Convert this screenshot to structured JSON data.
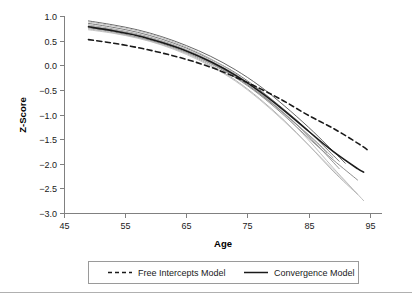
{
  "chart_data": {
    "type": "line",
    "title": "",
    "xlabel": "Age",
    "ylabel": "Z-Score",
    "xlim": [
      45,
      97
    ],
    "ylim": [
      -3.0,
      1.0
    ],
    "grid": false,
    "legend_position": "bottom",
    "xticks": [
      45,
      55,
      65,
      75,
      85,
      95
    ],
    "xtick_labels": [
      "45",
      "55",
      "65",
      "75",
      "85",
      "95"
    ],
    "yticks": [
      1.0,
      0.5,
      0.0,
      -0.5,
      -1.0,
      -1.5,
      -2.0,
      -2.5,
      -3.0
    ],
    "ytick_labels": [
      "1.0",
      "0.5",
      "0.0",
      "-0.5",
      "-1.0",
      "-1.5",
      "-2.0",
      "-2.5",
      "-3.0"
    ],
    "x": [
      49,
      53,
      57,
      61,
      65,
      69,
      73,
      77,
      81,
      85,
      89,
      93,
      95
    ],
    "series": [
      {
        "name": "Free Intercepts Model",
        "style": "dashed",
        "color": "#1a1a1a",
        "width": 1.6,
        "x": [
          49,
          53,
          57,
          61,
          65,
          69,
          73,
          77,
          81,
          85,
          89,
          93,
          95
        ],
        "values": [
          0.52,
          0.45,
          0.36,
          0.25,
          0.12,
          -0.04,
          -0.24,
          -0.47,
          -0.73,
          -1.02,
          -1.28,
          -1.58,
          -1.75
        ]
      },
      {
        "name": "Convergence Model",
        "style": "solid",
        "color": "#1a1a1a",
        "width": 1.6,
        "x": [
          49,
          53,
          57,
          61,
          65,
          69,
          73,
          77,
          81,
          85,
          89,
          93,
          94
        ],
        "values": [
          0.78,
          0.7,
          0.6,
          0.46,
          0.29,
          0.07,
          -0.2,
          -0.53,
          -0.92,
          -1.34,
          -1.75,
          -2.1,
          -2.17
        ]
      },
      {
        "name": "cohort-1",
        "style": "solid",
        "color": "#555555",
        "width": 0.9,
        "x": [
          49,
          53,
          57,
          61,
          65,
          69,
          73,
          77,
          81,
          85,
          88,
          91
        ],
        "values": [
          0.9,
          0.82,
          0.72,
          0.58,
          0.4,
          0.18,
          -0.09,
          -0.42,
          -0.82,
          -1.26,
          -1.62,
          -1.99
        ]
      },
      {
        "name": "cohort-2",
        "style": "solid",
        "color": "#6a6a6a",
        "width": 0.9,
        "x": [
          49,
          53,
          57,
          61,
          65,
          69,
          73,
          77,
          81,
          84,
          87,
          90
        ],
        "values": [
          0.85,
          0.77,
          0.67,
          0.53,
          0.35,
          0.12,
          -0.15,
          -0.5,
          -0.9,
          -1.22,
          -1.58,
          -1.95
        ]
      },
      {
        "name": "cohort-3",
        "style": "solid",
        "color": "#808080",
        "width": 0.9,
        "x": [
          49,
          53,
          57,
          61,
          65,
          69,
          73,
          77,
          81,
          85,
          89,
          93
        ],
        "values": [
          0.76,
          0.68,
          0.57,
          0.44,
          0.26,
          0.03,
          -0.25,
          -0.6,
          -1.02,
          -1.48,
          -1.92,
          -2.33
        ]
      },
      {
        "name": "cohort-4",
        "style": "solid",
        "color": "#949494",
        "width": 0.9,
        "x": [
          49,
          53,
          57,
          61,
          65,
          69,
          73,
          77,
          80,
          83,
          86,
          89
        ],
        "values": [
          0.8,
          0.72,
          0.62,
          0.48,
          0.3,
          0.07,
          -0.22,
          -0.58,
          -0.88,
          -1.2,
          -1.52,
          -1.88
        ]
      },
      {
        "name": "cohort-5",
        "style": "solid",
        "color": "#a8a8a8",
        "width": 0.9,
        "x": [
          49,
          53,
          57,
          61,
          65,
          69,
          73,
          77,
          81,
          85,
          89,
          93
        ],
        "values": [
          0.74,
          0.66,
          0.56,
          0.42,
          0.24,
          0.0,
          -0.3,
          -0.68,
          -1.12,
          -1.62,
          -2.15,
          -2.62
        ]
      },
      {
        "name": "cohort-6",
        "style": "solid",
        "color": "#b5b5b5",
        "width": 0.9,
        "x": [
          49,
          53,
          57,
          61,
          65,
          69,
          73,
          77,
          81,
          85,
          89,
          94
        ],
        "values": [
          0.88,
          0.8,
          0.7,
          0.56,
          0.37,
          0.13,
          -0.17,
          -0.55,
          -1.0,
          -1.52,
          -2.08,
          -2.75
        ]
      },
      {
        "name": "cohort-7",
        "style": "solid",
        "color": "#9e9e9e",
        "width": 0.9,
        "x": [
          49,
          53,
          57,
          61,
          65,
          69,
          73,
          76,
          79,
          82,
          85,
          88
        ],
        "values": [
          0.82,
          0.74,
          0.64,
          0.5,
          0.32,
          0.09,
          -0.19,
          -0.46,
          -0.76,
          -1.08,
          -1.42,
          -1.78
        ]
      },
      {
        "name": "cohort-8",
        "style": "solid",
        "color": "#8a8a8a",
        "width": 0.9,
        "x": [
          49,
          53,
          57,
          61,
          65,
          69,
          73,
          77,
          81,
          84,
          87,
          90
        ],
        "values": [
          0.78,
          0.71,
          0.61,
          0.47,
          0.29,
          0.05,
          -0.23,
          -0.58,
          -0.98,
          -1.32,
          -1.7,
          -2.1
        ]
      },
      {
        "name": "cohort-9",
        "style": "solid",
        "color": "#c0c0c0",
        "width": 0.9,
        "x": [
          49,
          53,
          57,
          61,
          65,
          69,
          73,
          77,
          81,
          85,
          89,
          92
        ],
        "values": [
          0.72,
          0.65,
          0.55,
          0.41,
          0.22,
          -0.02,
          -0.32,
          -0.7,
          -1.14,
          -1.62,
          -2.12,
          -2.48
        ]
      }
    ],
    "legend": [
      {
        "label": "Free Intercepts Model",
        "style": "dashed",
        "color": "#1a1a1a"
      },
      {
        "label": "Convergence Model",
        "style": "solid",
        "color": "#1a1a1a"
      }
    ]
  }
}
